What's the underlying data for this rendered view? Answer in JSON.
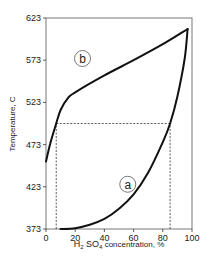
{
  "chart_data": {
    "type": "line",
    "title": "",
    "xlabel": "H2SO4 concentration, %",
    "xlabel_parts": {
      "h": "H",
      "sub1": "2",
      "so": " SO",
      "sub2": "4",
      "rest": " concentration, %"
    },
    "ylabel": "Temperature, C",
    "xlim": [
      0,
      100
    ],
    "ylim": [
      373,
      623
    ],
    "x_ticks": [
      0,
      20,
      40,
      60,
      80,
      100
    ],
    "y_ticks": [
      373,
      423,
      473,
      523,
      573,
      623
    ],
    "grid": false,
    "legend": "none",
    "series": [
      {
        "name": "a",
        "label": "a",
        "x": [
          10,
          20,
          30,
          40,
          50,
          60,
          70,
          80,
          85,
          90,
          95,
          97
        ],
        "y": [
          373,
          374,
          378,
          385,
          397,
          414,
          440,
          476,
          498,
          530,
          575,
          610
        ]
      },
      {
        "name": "b",
        "label": "b",
        "x": [
          0,
          3,
          7,
          10,
          15,
          20,
          40,
          60,
          80,
          97
        ],
        "y": [
          453,
          475,
          498,
          514,
          528,
          535,
          555,
          573,
          592,
          610
        ]
      }
    ],
    "annotations": {
      "dashed_horizontal": {
        "y": 498,
        "x_from": 7,
        "x_to": 85
      },
      "dashed_verticals": [
        {
          "x": 7,
          "y_from": 373,
          "y_to": 498
        },
        {
          "x": 85,
          "y_from": 373,
          "y_to": 498
        }
      ],
      "labels": [
        {
          "text": "b",
          "x": 25,
          "y": 575
        },
        {
          "text": "a",
          "x": 56,
          "y": 426
        }
      ]
    }
  }
}
